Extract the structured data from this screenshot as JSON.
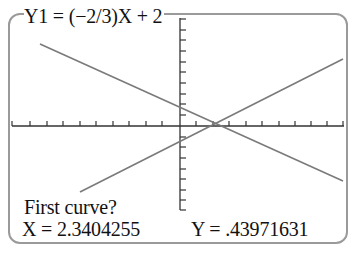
{
  "graph": {
    "equation_label": "Y1 = (−2/3)X + 2",
    "prompt": "First curve?",
    "x_readout": "X = 2.3404255",
    "y_readout": "Y = .43971631",
    "window": {
      "xmin": -10,
      "xmax": 10,
      "xscl": 1,
      "ymin": -8,
      "ymax": 10,
      "yscl": 1
    },
    "functions": [
      {
        "name": "Y1",
        "expression": "(-2/3)X + 2",
        "selected": true
      },
      {
        "name": "Y2",
        "expression": "increasing line through intersection",
        "selected": false
      }
    ],
    "trace_point": {
      "x": 2.3404255,
      "y": 0.43971631
    },
    "colors": {
      "axis": "#333333",
      "line": "#7a7a7a",
      "border": "#9a9a9a",
      "text": "#111111"
    }
  }
}
